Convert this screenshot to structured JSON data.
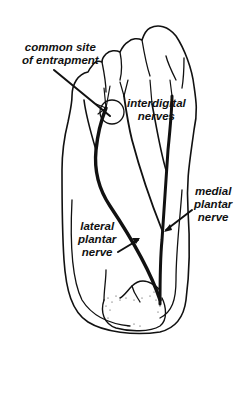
{
  "diagram": {
    "labels": {
      "entrapment": {
        "line1": "common site",
        "line2": "of entrapment"
      },
      "interdigital": {
        "line1": "interdigital",
        "line2": "nerves"
      },
      "medial": {
        "line1": "medial",
        "line2": "plantar",
        "line3": "nerve"
      },
      "lateral": {
        "line1": "lateral",
        "line2": "plantar",
        "line3": "nerve"
      }
    },
    "colors": {
      "ink": "#111111",
      "background": "#ffffff"
    }
  }
}
